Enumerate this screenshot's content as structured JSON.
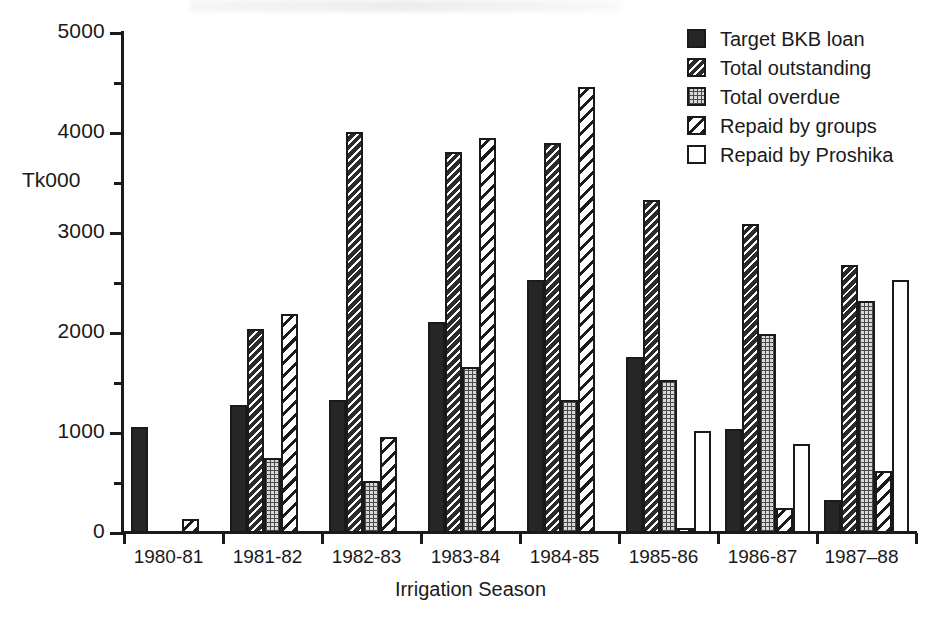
{
  "chart_data": {
    "type": "bar",
    "title": "",
    "xlabel": "Irrigation Season",
    "ylabel": "Tk000",
    "ylim": [
      0,
      5000
    ],
    "yticks": [
      0,
      1000,
      2000,
      3000,
      4000,
      5000
    ],
    "ytick_labels": [
      "0",
      "1000",
      "2000",
      "3000",
      "4000",
      "5000"
    ],
    "yminor_ticks": [
      500,
      1500,
      2500,
      3500,
      4500
    ],
    "grid": false,
    "legend_position": "top-right",
    "categories": [
      "1980-81",
      "1981-82",
      "1982-83",
      "1983-84",
      "1984-85",
      "1985-86",
      "1986-87",
      "1987–88"
    ],
    "series": [
      {
        "name": "Target BKB loan",
        "pattern": "solid-black",
        "values": [
          1060,
          1280,
          1330,
          2110,
          2530,
          1760,
          1040,
          330
        ]
      },
      {
        "name": "Total outstanding",
        "pattern": "dense-diagonal-hatch",
        "values": [
          0,
          2040,
          4010,
          3810,
          3900,
          3330,
          3090,
          2680
        ]
      },
      {
        "name": "Total overdue",
        "pattern": "fine-dotted",
        "values": [
          0,
          750,
          520,
          1660,
          1330,
          1530,
          1990,
          2320
        ]
      },
      {
        "name": "Repaid by groups",
        "pattern": "open-diagonal-hatch",
        "values": [
          145,
          2190,
          960,
          3950,
          4460,
          50,
          250,
          620
        ]
      },
      {
        "name": "Repaid by Proshika",
        "pattern": "open-white",
        "values": [
          0,
          0,
          0,
          0,
          0,
          1020,
          890,
          2530
        ]
      }
    ]
  },
  "legend": {
    "items": [
      {
        "label": "Target BKB loan",
        "swatch": "solid"
      },
      {
        "label": "Total outstanding",
        "swatch": "dense-hatch"
      },
      {
        "label": "Total overdue",
        "swatch": "dotted"
      },
      {
        "label": "Repaid by groups",
        "swatch": "open-hatch"
      },
      {
        "label": "Repaid by Proshika",
        "swatch": "open"
      }
    ]
  },
  "colors": {
    "ink": "#1a1a1a",
    "background": "#ffffff",
    "bar_solid": "#262626",
    "bar_dotted": "#d8d8d8"
  }
}
